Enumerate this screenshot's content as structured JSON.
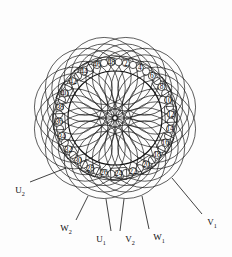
{
  "figure": {
    "type": "stator-winding-diagram",
    "slot_count": 48,
    "phases": 3,
    "line_color": "#1a1a1a",
    "background": "#ffffff"
  },
  "ring": {
    "center_x": 115,
    "center_y": 118,
    "inner_radius": 47,
    "slot_radius": 56,
    "dot_radius": 3.6
  },
  "slots": {
    "labeled_numbers": [
      2,
      4,
      6,
      8,
      10,
      12,
      14,
      16,
      18,
      20,
      22,
      24,
      26,
      28,
      30,
      32,
      34,
      36,
      38,
      40,
      42,
      44,
      46,
      48
    ],
    "boxed_numbers": [
      8,
      12,
      16,
      20,
      24,
      28,
      32,
      36,
      40,
      44
    ],
    "plain_numbers": [
      2,
      4,
      6,
      10,
      14,
      18,
      22,
      26,
      30,
      34,
      38,
      42,
      46,
      48
    ]
  },
  "coils": {
    "group_count": 12,
    "outer_radius": 40,
    "description": "overlapping end-winding coil groups"
  },
  "terminals": [
    {
      "id": "U2",
      "letter": "U",
      "sub": "2",
      "x": 20,
      "y": 190,
      "from_x": 66,
      "from_y": 168
    },
    {
      "id": "W2",
      "letter": "W",
      "sub": "2",
      "x": 66,
      "y": 228,
      "from_x": 88,
      "from_y": 196
    },
    {
      "id": "U1",
      "letter": "U",
      "sub": "1",
      "x": 101,
      "y": 239,
      "from_x": 106,
      "from_y": 199
    },
    {
      "id": "V2",
      "letter": "V",
      "sub": "2",
      "x": 130,
      "y": 239,
      "from_x": 124,
      "from_y": 199
    },
    {
      "id": "W1",
      "letter": "W",
      "sub": "1",
      "x": 159,
      "y": 237,
      "from_x": 142,
      "from_y": 196
    },
    {
      "id": "V1",
      "letter": "V",
      "sub": "1",
      "x": 212,
      "y": 222,
      "from_x": 172,
      "from_y": 178
    }
  ]
}
